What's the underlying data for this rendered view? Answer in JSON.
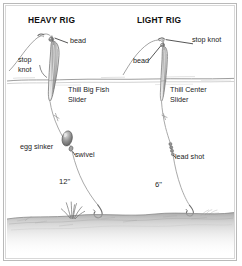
{
  "figure": {
    "kind": "slip-float-fishing-rig-diagram",
    "background_color": "#ffffff",
    "frame_color": "#b9b9b9",
    "ink_color": "#4a4a4a",
    "text_color": "#1d1d1d"
  },
  "rigs": [
    {
      "id": "heavy",
      "title": "HEAVY RIG",
      "float_label": "Thill Big Fish\nSlider",
      "float_label_line1": "Thill Big Fish",
      "float_label_line2": "Slider",
      "stop_knot_label_line1": "stop",
      "stop_knot_label_line2": "knot",
      "bead_label": "bead",
      "weight_label": "egg sinker",
      "connector_label": "swivel",
      "leader_length": "12\""
    },
    {
      "id": "light",
      "title": "LIGHT RIG",
      "float_label_line1": "Thill Center",
      "float_label_line2": "Slider",
      "stop_knot_label": "stop knot",
      "bead_label": "bead",
      "weight_label": "lead shot",
      "leader_length": "6\""
    }
  ],
  "scene": {
    "waterline": true,
    "bottom_substrate": true,
    "weeds": true
  }
}
